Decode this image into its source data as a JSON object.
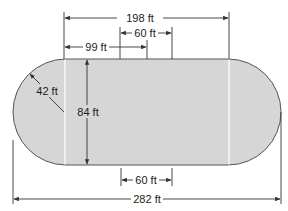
{
  "diagram": {
    "type": "running-track-dimensions",
    "colors": {
      "track_fill": "#d6d6d6",
      "track_outline": "#555555",
      "dimension_line": "#333333",
      "divider_line": "#ffffff",
      "background": "#ffffff"
    },
    "labels": {
      "straight_length": "198 ft",
      "segment_top": "60 ft",
      "half_length": "99 ft",
      "radius": "42 ft",
      "width": "84 ft",
      "segment_bottom": "60 ft",
      "total_length": "282 ft"
    },
    "dimensions": {
      "total_length_ft": 282,
      "straight_length_ft": 198,
      "half_straight_ft": 99,
      "width_ft": 84,
      "radius_ft": 42,
      "center_segment_ft": 60
    }
  }
}
